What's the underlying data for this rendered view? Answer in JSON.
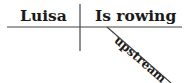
{
  "diagram": {
    "type": "sentence-diagram",
    "subject": "Luisa",
    "predicate": "Is rowing",
    "modifier": "upstream",
    "colors": {
      "line": "#444444",
      "text": "#1a1a1a"
    }
  }
}
